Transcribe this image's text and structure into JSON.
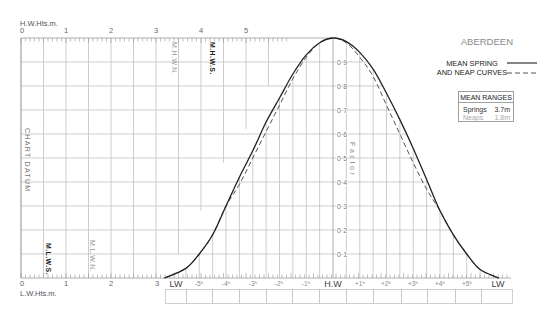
{
  "title": "ABERDEEN",
  "legend": {
    "line1": "MEAN SPRING",
    "line2": "AND NEAP CURVES",
    "spring_style": "solid",
    "neap_style": "dashed"
  },
  "mean_ranges": {
    "title": "MEAN RANGES",
    "rows": [
      {
        "label": "Springs",
        "value": "3.7m"
      },
      {
        "label": "Neaps",
        "value": "1.8m"
      }
    ]
  },
  "axes": {
    "hw_heights": {
      "label": "H.W.Hts.m.",
      "ticks": [
        "0",
        "1",
        "2",
        "3",
        "4",
        "5"
      ]
    },
    "lw_heights": {
      "label": "L.W.Hts.m.",
      "ticks": [
        "0",
        "1",
        "2",
        "3"
      ]
    },
    "factor": {
      "label": "Factor",
      "ticks": [
        "0·1",
        "0·2",
        "0·3",
        "0·4",
        "0·5",
        "0·6",
        "0·7",
        "0·8",
        "0·9"
      ]
    },
    "time": {
      "ticks": [
        "LW",
        "-5ʰ",
        "-4ʰ",
        "-3ʰ",
        "-2ʰ",
        "-1ʰ",
        "H.W",
        "+1ʰ",
        "+2ʰ",
        "+3ʰ",
        "+4ʰ",
        "+5ʰ",
        "LW"
      ]
    }
  },
  "annotations": {
    "chart_datum": "CHART DATUM",
    "mlws": "M.L.W.S.",
    "mlwn": "M.L.W.N.",
    "mhwn": "M.H.W.N.",
    "mhws": "M.H.W.S."
  },
  "colors": {
    "curve": "#222222",
    "neap_curve": "#555555",
    "grid": "#b8b8b8",
    "axis": "#999999",
    "title": "#8a8a8a"
  },
  "chart_data": {
    "type": "line",
    "title": "ABERDEEN",
    "subtitle": "MEAN SPRING AND NEAP CURVES",
    "xlabel": "Time from H.W (hours)",
    "ylabel": "Factor",
    "x_tick_labels": [
      "LW",
      "-5h",
      "-4h",
      "-3h",
      "-2h",
      "-1h",
      "H.W",
      "+1h",
      "+2h",
      "+3h",
      "+4h",
      "+5h",
      "LW"
    ],
    "y_tick_labels": [
      "0.1",
      "0.2",
      "0.3",
      "0.4",
      "0.5",
      "0.6",
      "0.7",
      "0.8",
      "0.9"
    ],
    "xlim": [
      -6.3,
      6.2
    ],
    "ylim": [
      0,
      1
    ],
    "grid": true,
    "legend_position": "top-right",
    "height_scales": {
      "hw_heights_m": {
        "label": "H.W.Hts.m.",
        "range": [
          0,
          6
        ],
        "tick_labels": [
          "0",
          "1",
          "2",
          "3",
          "4",
          "5"
        ]
      },
      "lw_heights_m": {
        "label": "L.W.Hts.m.",
        "range": [
          0,
          3
        ],
        "tick_labels": [
          "0",
          "1",
          "2",
          "3"
        ]
      },
      "marked_levels": [
        "M.L.W.S.",
        "M.L.W.N.",
        "M.H.W.N.",
        "M.H.W.S.",
        "CHART DATUM"
      ]
    },
    "mean_ranges_m": {
      "springs": 3.7,
      "neaps": 1.8
    },
    "series": [
      {
        "name": "Mean Spring",
        "style": "solid",
        "x": [
          -6.3,
          -5.5,
          -5,
          -4.5,
          -4,
          -3.5,
          -3,
          -2.5,
          -2,
          -1.5,
          -1,
          -0.5,
          0,
          0.5,
          1,
          1.5,
          2,
          2.5,
          3,
          3.5,
          4,
          4.5,
          5,
          5.5,
          6.2
        ],
        "y": [
          0,
          0.04,
          0.1,
          0.18,
          0.3,
          0.42,
          0.53,
          0.65,
          0.75,
          0.85,
          0.93,
          0.98,
          1.0,
          0.985,
          0.94,
          0.87,
          0.77,
          0.66,
          0.54,
          0.41,
          0.28,
          0.18,
          0.1,
          0.035,
          0
        ]
      },
      {
        "name": "Mean Neap",
        "style": "dashed",
        "x": [
          -6.3,
          -5.5,
          -5,
          -4.5,
          -4,
          -3.5,
          -3,
          -2.5,
          -2,
          -1.5,
          -1,
          -0.5,
          0,
          0.5,
          1,
          1.5,
          2,
          2.5,
          3,
          3.5,
          4,
          4.5,
          5,
          5.5,
          6.2
        ],
        "y": [
          0,
          0.04,
          0.1,
          0.18,
          0.3,
          0.39,
          0.5,
          0.61,
          0.72,
          0.83,
          0.92,
          0.98,
          1.0,
          0.98,
          0.92,
          0.84,
          0.72,
          0.6,
          0.48,
          0.37,
          0.28,
          0.18,
          0.1,
          0.035,
          0
        ]
      }
    ]
  }
}
